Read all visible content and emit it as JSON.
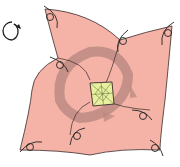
{
  "diagram": {
    "type": "origami-fold-step",
    "colors": {
      "paper": "#f4b3a6",
      "paper_shadow": "#b8877f",
      "center": "#e8f0a0",
      "line": "#3a2a2a",
      "background": "#ffffff"
    },
    "symbols": {
      "turn_over": "rotate-arrow-icon",
      "fold_arrows": 8
    }
  }
}
